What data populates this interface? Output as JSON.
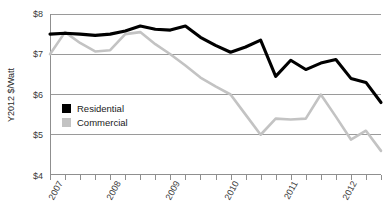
{
  "chart_data": {
    "type": "line",
    "title": "",
    "xlabel": "",
    "ylabel": "Y2012 $/Watt",
    "ylim": [
      4,
      8
    ],
    "ytick_labels": [
      "$8",
      "$7",
      "$6",
      "$5",
      "$4"
    ],
    "ytick_values": [
      8,
      7,
      6,
      5,
      4
    ],
    "grid": true,
    "legend_position": "inside-left-middle",
    "x_tick_count": 23,
    "xtick_labels": [
      "2007",
      "2008",
      "2009",
      "2010",
      "2011",
      "2012"
    ],
    "xtick_label_values": [
      2007,
      2008,
      2009,
      2010,
      2011,
      2012
    ],
    "x": [
      2007.0,
      2007.25,
      2007.5,
      2007.75,
      2008.0,
      2008.25,
      2008.5,
      2008.75,
      2009.0,
      2009.25,
      2009.5,
      2009.75,
      2010.0,
      2010.25,
      2010.5,
      2010.75,
      2011.0,
      2011.25,
      2011.5,
      2011.75,
      2012.0,
      2012.25,
      2012.5
    ],
    "series": [
      {
        "name": "Residential",
        "color": "#000000",
        "values": [
          7.5,
          7.52,
          7.5,
          7.47,
          7.5,
          7.58,
          7.7,
          7.62,
          7.6,
          7.7,
          7.42,
          7.22,
          7.05,
          7.18,
          7.35,
          6.45,
          6.85,
          6.62,
          6.78,
          6.87,
          6.4,
          6.3,
          5.8
        ]
      },
      {
        "name": "Commercial",
        "color": "#c3c3c3",
        "values": [
          7.0,
          7.55,
          7.28,
          7.07,
          7.1,
          7.5,
          7.55,
          7.25,
          7.0,
          6.72,
          6.42,
          6.2,
          6.0,
          5.5,
          5.0,
          5.4,
          5.38,
          5.4,
          6.0,
          5.45,
          4.88,
          5.1,
          4.6
        ]
      }
    ],
    "legend": [
      {
        "label": "Residential",
        "color": "#000000",
        "marker": "square"
      },
      {
        "label": "Commercial",
        "color": "#c3c3c3",
        "marker": "square"
      }
    ]
  }
}
